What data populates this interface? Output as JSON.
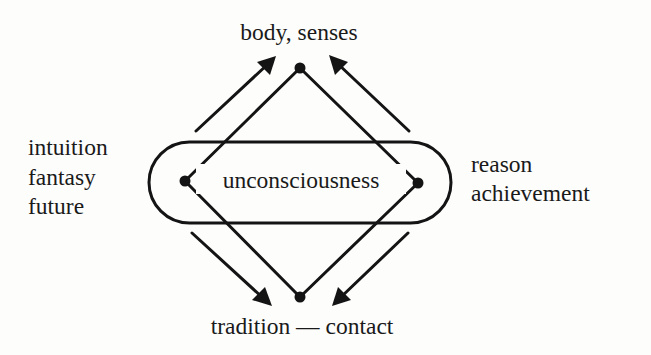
{
  "diagram": {
    "top_label": "body, senses",
    "bottom_label": "tradition — contact",
    "center_label": "unconsciousness",
    "left_labels": [
      "intuition",
      "fantasy",
      "future"
    ],
    "right_labels": [
      "reason",
      "achievement"
    ],
    "nodes": [
      "top",
      "left",
      "right",
      "bottom"
    ],
    "arrows": [
      {
        "name": "arrow-left-up",
        "direction": "toward body, senses"
      },
      {
        "name": "arrow-right-up",
        "direction": "toward body, senses"
      },
      {
        "name": "arrow-left-down",
        "direction": "toward tradition — contact"
      },
      {
        "name": "arrow-right-down",
        "direction": "toward tradition — contact"
      }
    ],
    "ink_color": "#141414"
  }
}
